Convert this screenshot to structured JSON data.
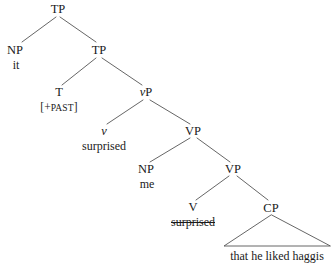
{
  "figure": {
    "type": "syntax-tree",
    "sentence": "it [+PAST] surprised me surprised that he liked haggis",
    "background_color": "#ffffff",
    "line_color": "#555555",
    "text_color": "#1a1a1a"
  },
  "nodes": {
    "tp_root": {
      "label": "TP",
      "x": 58,
      "y": 9
    },
    "np_subject": {
      "label": "NP",
      "x": 15,
      "y": 50
    },
    "np_subject_terminal": {
      "label": "it",
      "x": 16,
      "y": 65
    },
    "tp_inner": {
      "label": "TP",
      "x": 99,
      "y": 50
    },
    "t_head": {
      "label": "T",
      "x": 59,
      "y": 92
    },
    "t_feature_open": {
      "label": "[+",
      "x": 0,
      "y": 0
    },
    "t_feature": {
      "label": "[+PAST]",
      "bracket_open": "[+",
      "small_caps": "PAST",
      "bracket_close": "]",
      "x": 59,
      "y": 108
    },
    "vp_little": {
      "label": "vP",
      "italic_prefix": "v",
      "plain_suffix": "P",
      "x": 146,
      "y": 92
    },
    "v_little": {
      "label": "v",
      "x": 104,
      "y": 131
    },
    "v_little_terminal": {
      "label": "surprised",
      "x": 104,
      "y": 146,
      "struck": false
    },
    "vp_upper": {
      "label": "VP",
      "x": 193,
      "y": 131
    },
    "np_object": {
      "label": "NP",
      "x": 146,
      "y": 169
    },
    "np_object_terminal": {
      "label": "me",
      "x": 147,
      "y": 184
    },
    "vp_lower": {
      "label": "VP",
      "x": 233,
      "y": 169
    },
    "v_head": {
      "label": "V",
      "x": 193,
      "y": 207
    },
    "v_head_terminal": {
      "label": "surprised",
      "x": 193,
      "y": 222,
      "struck": true
    },
    "cp": {
      "label": "CP",
      "x": 271,
      "y": 208
    },
    "cp_terminal": {
      "label": "that he liked haggis",
      "x": 277,
      "y": 256
    }
  },
  "branches": [
    {
      "from": "tp_root",
      "to": "np_subject"
    },
    {
      "from": "tp_root",
      "to": "tp_inner"
    },
    {
      "from": "tp_inner",
      "to": "t_head"
    },
    {
      "from": "tp_inner",
      "to": "vp_little"
    },
    {
      "from": "vp_little",
      "to": "v_little"
    },
    {
      "from": "vp_little",
      "to": "vp_upper"
    },
    {
      "from": "vp_upper",
      "to": "np_object"
    },
    {
      "from": "vp_upper",
      "to": "vp_lower"
    },
    {
      "from": "vp_lower",
      "to": "v_head"
    },
    {
      "from": "vp_lower",
      "to": "cp"
    }
  ],
  "triangle": {
    "apex_x": 271,
    "apex_y": 215,
    "left_x": 224,
    "right_x": 330,
    "base_y": 246
  }
}
